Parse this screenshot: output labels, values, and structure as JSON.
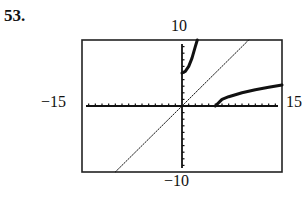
{
  "problem": {
    "number": "53."
  },
  "window": {
    "ymax_label": "10",
    "ymin_label": "−10",
    "xmin_label": "−15",
    "xmax_label": "15"
  },
  "chart_data": {
    "type": "line",
    "title": "",
    "xlabel": "",
    "ylabel": "",
    "xlim": [
      -15,
      15
    ],
    "ylim": [
      -10,
      10
    ],
    "grid": false,
    "axis_ticks": "every 1 unit",
    "legend": null,
    "series": [
      {
        "name": "f(x) = x^2 + 5, x >= 0",
        "style": "thick",
        "x": [
          0,
          0.5,
          1,
          1.5,
          2,
          2.3
        ],
        "y": [
          5,
          5.25,
          6,
          7.25,
          9,
          10
        ]
      },
      {
        "name": "f^-1(x) = sqrt(x - 5)",
        "style": "thick",
        "x": [
          5,
          6,
          7,
          9,
          11,
          13,
          15
        ],
        "y": [
          0,
          1,
          1.41,
          2,
          2.45,
          2.83,
          3.16
        ]
      },
      {
        "name": "y = x",
        "style": "dotted",
        "x": [
          -10,
          10
        ],
        "y": [
          -10,
          10
        ]
      }
    ]
  }
}
